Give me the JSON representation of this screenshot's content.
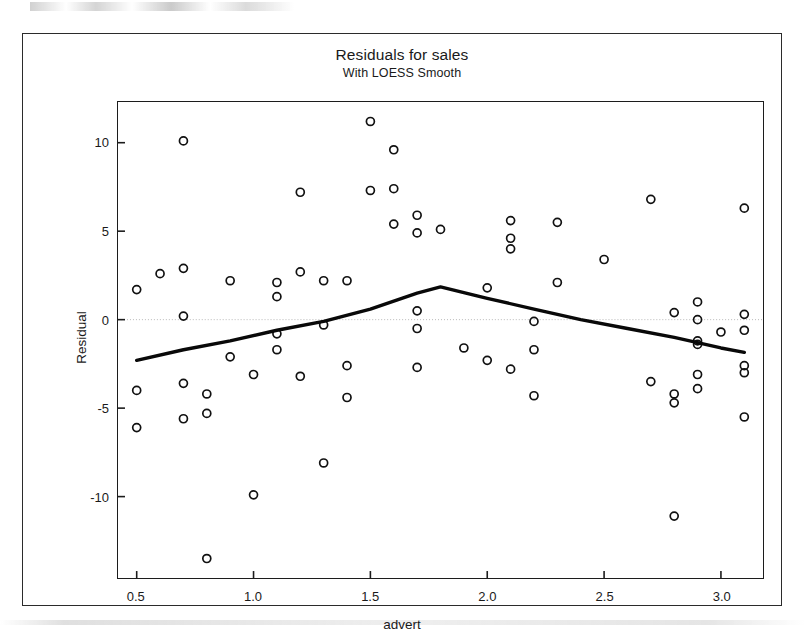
{
  "figure": {
    "title": "Residuals for sales",
    "subtitle": "With LOESS Smooth"
  },
  "chart_data": {
    "type": "scatter",
    "title": "Residuals for sales",
    "subtitle": "With LOESS Smooth",
    "xlabel": "advert",
    "ylabel": "Residual",
    "xlim": [
      0.42,
      3.18
    ],
    "ylim": [
      -14.6,
      12.3
    ],
    "xticks": [
      0.5,
      1.0,
      1.5,
      2.0,
      2.5,
      3.0
    ],
    "xtick_labels": [
      "0.5",
      "1.0",
      "1.5",
      "2.0",
      "2.5",
      "3.0"
    ],
    "yticks": [
      10,
      5,
      0,
      -5,
      -10
    ],
    "ytick_labels": [
      "10",
      "5",
      "0",
      "-5",
      "-10"
    ],
    "grid": false,
    "zero_reference_line": 0,
    "marker": "open-circle",
    "points": [
      {
        "x": 0.5,
        "y": 1.7
      },
      {
        "x": 0.5,
        "y": -4.0
      },
      {
        "x": 0.5,
        "y": -6.1
      },
      {
        "x": 0.6,
        "y": 2.6
      },
      {
        "x": 0.7,
        "y": 10.1
      },
      {
        "x": 0.7,
        "y": 2.9
      },
      {
        "x": 0.7,
        "y": 0.2
      },
      {
        "x": 0.7,
        "y": -3.6
      },
      {
        "x": 0.7,
        "y": -5.6
      },
      {
        "x": 0.8,
        "y": -4.2
      },
      {
        "x": 0.8,
        "y": -5.3
      },
      {
        "x": 0.8,
        "y": -13.5
      },
      {
        "x": 0.9,
        "y": 2.2
      },
      {
        "x": 0.9,
        "y": -2.1
      },
      {
        "x": 1.0,
        "y": -3.1
      },
      {
        "x": 1.0,
        "y": -9.9
      },
      {
        "x": 1.1,
        "y": 2.1
      },
      {
        "x": 1.1,
        "y": 1.3
      },
      {
        "x": 1.1,
        "y": -0.8
      },
      {
        "x": 1.1,
        "y": -1.7
      },
      {
        "x": 1.2,
        "y": 7.2
      },
      {
        "x": 1.2,
        "y": 2.7
      },
      {
        "x": 1.2,
        "y": -3.2
      },
      {
        "x": 1.3,
        "y": 2.2
      },
      {
        "x": 1.3,
        "y": -0.3
      },
      {
        "x": 1.3,
        "y": -8.1
      },
      {
        "x": 1.4,
        "y": 2.2
      },
      {
        "x": 1.4,
        "y": -2.6
      },
      {
        "x": 1.4,
        "y": -4.4
      },
      {
        "x": 1.5,
        "y": 11.2
      },
      {
        "x": 1.5,
        "y": 7.3
      },
      {
        "x": 1.6,
        "y": 9.6
      },
      {
        "x": 1.6,
        "y": 7.4
      },
      {
        "x": 1.6,
        "y": 5.4
      },
      {
        "x": 1.7,
        "y": 5.9
      },
      {
        "x": 1.7,
        "y": 4.9
      },
      {
        "x": 1.7,
        "y": 0.5
      },
      {
        "x": 1.7,
        "y": -0.5
      },
      {
        "x": 1.7,
        "y": -2.7
      },
      {
        "x": 1.8,
        "y": 5.1
      },
      {
        "x": 1.9,
        "y": -1.6
      },
      {
        "x": 2.0,
        "y": 1.8
      },
      {
        "x": 2.0,
        "y": -2.3
      },
      {
        "x": 2.1,
        "y": 5.6
      },
      {
        "x": 2.1,
        "y": 4.6
      },
      {
        "x": 2.1,
        "y": 4.0
      },
      {
        "x": 2.1,
        "y": -2.8
      },
      {
        "x": 2.2,
        "y": -0.1
      },
      {
        "x": 2.2,
        "y": -1.7
      },
      {
        "x": 2.2,
        "y": -4.3
      },
      {
        "x": 2.3,
        "y": 5.5
      },
      {
        "x": 2.3,
        "y": 2.1
      },
      {
        "x": 2.5,
        "y": 3.4
      },
      {
        "x": 2.7,
        "y": 6.8
      },
      {
        "x": 2.7,
        "y": -3.5
      },
      {
        "x": 2.8,
        "y": 0.4
      },
      {
        "x": 2.8,
        "y": -4.2
      },
      {
        "x": 2.8,
        "y": -4.7
      },
      {
        "x": 2.8,
        "y": -11.1
      },
      {
        "x": 2.9,
        "y": 1.0
      },
      {
        "x": 2.9,
        "y": 0.0
      },
      {
        "x": 2.9,
        "y": -1.2
      },
      {
        "x": 2.9,
        "y": -1.4
      },
      {
        "x": 2.9,
        "y": -3.1
      },
      {
        "x": 2.9,
        "y": -3.9
      },
      {
        "x": 3.0,
        "y": -0.7
      },
      {
        "x": 3.1,
        "y": 6.3
      },
      {
        "x": 3.1,
        "y": 0.3
      },
      {
        "x": 3.1,
        "y": -0.6
      },
      {
        "x": 3.1,
        "y": -2.6
      },
      {
        "x": 3.1,
        "y": -3.0
      },
      {
        "x": 3.1,
        "y": -5.5
      }
    ],
    "loess_smooth": {
      "name": "LOESS Smooth",
      "x": [
        0.5,
        0.7,
        0.9,
        1.1,
        1.3,
        1.5,
        1.7,
        1.8,
        2.0,
        2.2,
        2.4,
        2.6,
        2.8,
        3.0,
        3.1
      ],
      "y": [
        -2.3,
        -1.7,
        -1.2,
        -0.6,
        -0.1,
        0.6,
        1.5,
        1.85,
        1.2,
        0.6,
        0.0,
        -0.5,
        -1.0,
        -1.6,
        -1.85
      ]
    }
  }
}
